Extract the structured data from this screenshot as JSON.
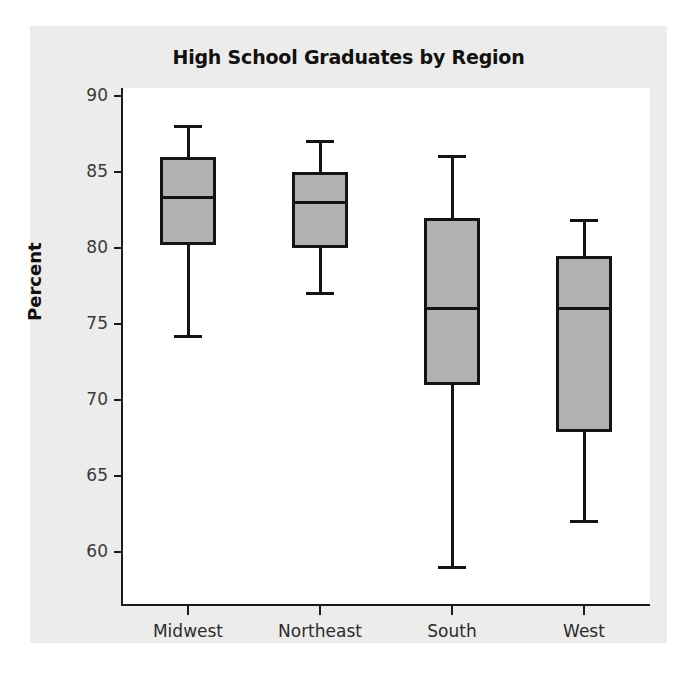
{
  "chart_data": {
    "type": "box",
    "title": "High School Graduates by Region",
    "xlabel": "",
    "ylabel": "Percent",
    "categories": [
      "Midwest",
      "Northeast",
      "South",
      "West"
    ],
    "ylim": [
      57.5,
      90.5
    ],
    "yticks": [
      90,
      85,
      80,
      75,
      70,
      65,
      60
    ],
    "ytick_labels": [
      "90",
      "85",
      "80",
      "75",
      "70",
      "65",
      "60"
    ],
    "grid": false,
    "legend": null,
    "box_fill_color": "#b2b2b2",
    "box_line_color": "#141414",
    "figure_background": "#ececea",
    "plot_background": "#ffffff",
    "boxes": [
      {
        "category": "Midwest",
        "whisker_low": 74.2,
        "q1": 80.2,
        "median": 83.3,
        "q3": 86.0,
        "whisker_high": 88.0
      },
      {
        "category": "Northeast",
        "whisker_low": 77.0,
        "q1": 80.0,
        "median": 83.0,
        "q3": 85.0,
        "whisker_high": 87.0
      },
      {
        "category": "South",
        "whisker_low": 59.0,
        "q1": 71.0,
        "median": 76.0,
        "q3": 82.0,
        "whisker_high": 86.0
      },
      {
        "category": "West",
        "whisker_low": 62.0,
        "q1": 67.9,
        "median": 76.0,
        "q3": 79.5,
        "whisker_high": 81.8
      }
    ]
  }
}
